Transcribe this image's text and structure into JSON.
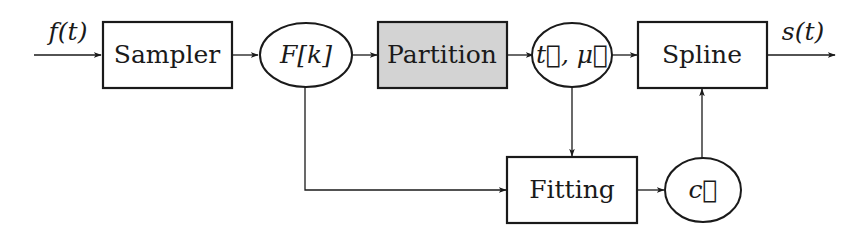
{
  "diagram": {
    "type": "block-diagram",
    "input": {
      "label": "f(t)"
    },
    "output": {
      "label": "s(t)"
    },
    "nodes": [
      {
        "id": "sampler",
        "shape": "rect",
        "label": "Sampler",
        "fill": "#ffffff"
      },
      {
        "id": "samples",
        "shape": "ellipse",
        "label": "F[k]"
      },
      {
        "id": "partition",
        "shape": "rect",
        "label": "Partition",
        "fill": "#d3d3d3"
      },
      {
        "id": "knots",
        "shape": "ellipse",
        "label": "t⃗, μ⃗"
      },
      {
        "id": "spline",
        "shape": "rect",
        "label": "Spline",
        "fill": "#ffffff"
      },
      {
        "id": "fitting",
        "shape": "rect",
        "label": "Fitting",
        "fill": "#ffffff"
      },
      {
        "id": "coeffs",
        "shape": "ellipse",
        "label": "c⃗"
      }
    ],
    "edges": [
      {
        "from": "input",
        "to": "sampler"
      },
      {
        "from": "sampler",
        "to": "samples"
      },
      {
        "from": "samples",
        "to": "partition"
      },
      {
        "from": "partition",
        "to": "knots"
      },
      {
        "from": "knots",
        "to": "spline"
      },
      {
        "from": "spline",
        "to": "output"
      },
      {
        "from": "knots",
        "to": "fitting"
      },
      {
        "from": "samples",
        "to": "fitting"
      },
      {
        "from": "fitting",
        "to": "coeffs"
      },
      {
        "from": "coeffs",
        "to": "spline"
      }
    ],
    "colors": {
      "stroke": "#1a1a1a",
      "highlight_fill": "#d3d3d3",
      "background": "#ffffff"
    }
  }
}
